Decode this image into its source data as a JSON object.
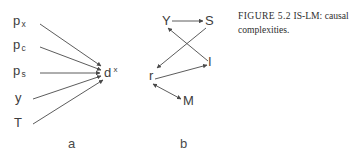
{
  "figure": {
    "caption_prefix": "FIGURE 5.2",
    "caption_text": "IS-LM: causal complexities.",
    "panel_a_label": "a",
    "panel_b_label": "b",
    "stroke_color": "#4a4a4a",
    "text_color": "#3d3d3d",
    "background_color": "#ffffff"
  },
  "panel_a": {
    "sources": [
      {
        "base": "p",
        "sub": "x"
      },
      {
        "base": "p",
        "sub": "c"
      },
      {
        "base": "p",
        "sub": "s"
      },
      {
        "base": "y",
        "sub": ""
      },
      {
        "base": "T",
        "sub": ""
      }
    ],
    "target": {
      "base": "d",
      "sup": "x"
    },
    "edges": [
      {
        "from": "p_x",
        "to": "d_x"
      },
      {
        "from": "p_c",
        "to": "d_x"
      },
      {
        "from": "p_s",
        "to": "d_x"
      },
      {
        "from": "y",
        "to": "d_x"
      },
      {
        "from": "T",
        "to": "d_x"
      }
    ]
  },
  "panel_b": {
    "nodes": [
      {
        "id": "Y",
        "label": "Y"
      },
      {
        "id": "S",
        "label": "S"
      },
      {
        "id": "r",
        "label": "r"
      },
      {
        "id": "I",
        "label": "I"
      },
      {
        "id": "M",
        "label": "M"
      }
    ],
    "edges": [
      {
        "from": "Y",
        "to": "S",
        "arrow": "single"
      },
      {
        "from": "S",
        "to": "r",
        "arrow": "single"
      },
      {
        "from": "I",
        "to": "Y",
        "arrow": "single"
      },
      {
        "from": "r",
        "to": "I",
        "arrow": "single"
      },
      {
        "from": "r",
        "to": "M",
        "arrow": "double"
      }
    ]
  }
}
